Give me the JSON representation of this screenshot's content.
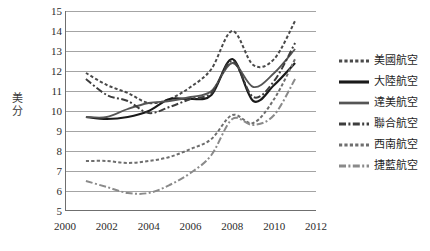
{
  "chart_data": {
    "type": "line",
    "title": "",
    "xlabel": "",
    "ylabel": "美分",
    "xlim": [
      2000,
      2012
    ],
    "ylim": [
      5,
      15
    ],
    "xticks": [
      2000,
      2002,
      2004,
      2006,
      2008,
      2010,
      2012
    ],
    "yticks": [
      5,
      6,
      7,
      8,
      9,
      10,
      11,
      12,
      13,
      14,
      15
    ],
    "grid": "horizontal",
    "legend_position": "right",
    "x": [
      2001,
      2002,
      2003,
      2004,
      2005,
      2006,
      2007,
      2008,
      2009,
      2010,
      2011
    ],
    "series": [
      {
        "name": "美國航空",
        "style": "dotted",
        "color": "#4a4a4a",
        "values": [
          11.9,
          11.3,
          10.9,
          10.4,
          10.6,
          11.2,
          12.1,
          14.0,
          12.3,
          12.6,
          14.5
        ]
      },
      {
        "name": "大陸航空",
        "style": "solid-thick",
        "color": "#1a1a1a",
        "values": [
          9.7,
          9.6,
          9.7,
          10.0,
          10.6,
          10.6,
          10.8,
          12.6,
          10.5,
          11.3,
          12.4
        ]
      },
      {
        "name": "達美航空",
        "style": "solid",
        "color": "#555555",
        "values": [
          9.7,
          9.7,
          10.1,
          10.4,
          10.5,
          10.7,
          11.0,
          12.4,
          11.2,
          11.9,
          13.1
        ]
      },
      {
        "name": "聯合航空",
        "style": "dash-dot",
        "color": "#3d3d3d",
        "values": [
          11.6,
          10.8,
          10.5,
          9.9,
          10.2,
          10.6,
          10.9,
          12.5,
          10.7,
          11.5,
          13.4
        ]
      },
      {
        "name": "西南航空",
        "style": "dotted",
        "color": "#6e6e6e",
        "values": [
          7.5,
          7.5,
          7.4,
          7.5,
          7.7,
          8.1,
          8.6,
          9.8,
          9.4,
          10.6,
          12.6
        ]
      },
      {
        "name": "捷藍航空",
        "style": "dash-dot",
        "color": "#8a8a8a",
        "values": [
          6.5,
          6.2,
          5.9,
          5.9,
          6.3,
          6.9,
          7.8,
          9.6,
          9.3,
          9.8,
          11.6
        ]
      }
    ]
  },
  "axis": {
    "y_title": "美分",
    "y_title_chars": [
      "美",
      "分"
    ],
    "y_tick_labels": [
      "15",
      "14",
      "13",
      "12",
      "11",
      "10",
      "9",
      "8",
      "7",
      "6",
      "5"
    ],
    "x_tick_labels": [
      "2000",
      "2002",
      "2004",
      "2006",
      "2008",
      "2010",
      "2012"
    ]
  },
  "legend": {
    "items": [
      {
        "label": "美國航空"
      },
      {
        "label": "大陸航空"
      },
      {
        "label": "達美航空"
      },
      {
        "label": "聯合航空"
      },
      {
        "label": "西南航空"
      },
      {
        "label": "捷藍航空"
      }
    ]
  }
}
